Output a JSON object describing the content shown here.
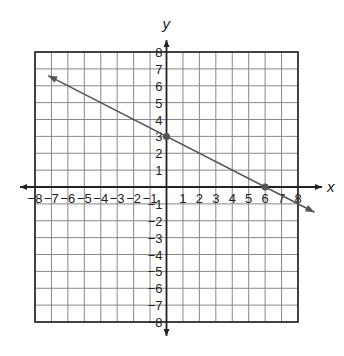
{
  "chart_data": {
    "type": "line",
    "title": "",
    "xlabel": "x",
    "ylabel": "y",
    "xlim": [
      -8,
      8
    ],
    "ylim": [
      -8,
      8
    ],
    "grid": true,
    "x_ticks": [
      -8,
      -7,
      -6,
      -5,
      -4,
      -3,
      -2,
      -1,
      1,
      2,
      3,
      4,
      5,
      6,
      7,
      8
    ],
    "y_ticks": [
      -8,
      -7,
      -6,
      -5,
      -4,
      -3,
      -2,
      -1,
      1,
      2,
      3,
      4,
      5,
      6,
      7,
      8
    ],
    "x_tick_labels": [
      "−8",
      "−7",
      "−6",
      "−5",
      "−4",
      "−3",
      "−2",
      "−1",
      "1",
      "2",
      "3",
      "4",
      "5",
      "6",
      "7",
      "8"
    ],
    "y_tick_labels": [
      "−8",
      "−7",
      "−6",
      "−5",
      "−4",
      "−3",
      "−2",
      "−1",
      "1",
      "2",
      "3",
      "4",
      "5",
      "6",
      "7",
      "8"
    ],
    "series": [
      {
        "name": "line",
        "equation": "y = -1/2 x + 3",
        "slope": -0.5,
        "intercept": 3,
        "x": [
          -7.2,
          9
        ],
        "y": [
          6.6,
          -1.5
        ],
        "arrows": "both",
        "color": "#555555"
      }
    ],
    "points": [
      {
        "x": 0,
        "y": 3,
        "label": "y-intercept"
      },
      {
        "x": 6,
        "y": 0,
        "label": "x-intercept"
      }
    ]
  },
  "colors": {
    "grid": "#888888",
    "border": "#222222",
    "axis": "#222222",
    "line": "#555555",
    "point": "#555555"
  }
}
